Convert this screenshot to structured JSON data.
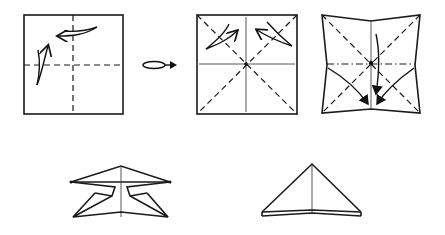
{
  "diagram": {
    "type": "origami-folding-instructions",
    "background": "#ffffff",
    "line_color": "#1a1a1a",
    "steps": [
      {
        "id": "step-1",
        "description": "square with valley folds in half both ways, fold and unfold arrows"
      },
      {
        "id": "flip",
        "description": "turn-over symbol"
      },
      {
        "id": "step-2",
        "description": "square with creases; valley fold diagonals, fold and unfold arrows"
      },
      {
        "id": "step-3",
        "description": "collapse along mountain horizontal and valley diagonals, arrows to bottom center"
      },
      {
        "id": "step-4",
        "description": "partially collapsed waterbomb base"
      },
      {
        "id": "step-5",
        "description": "finished triangle (waterbomb base)"
      }
    ]
  }
}
